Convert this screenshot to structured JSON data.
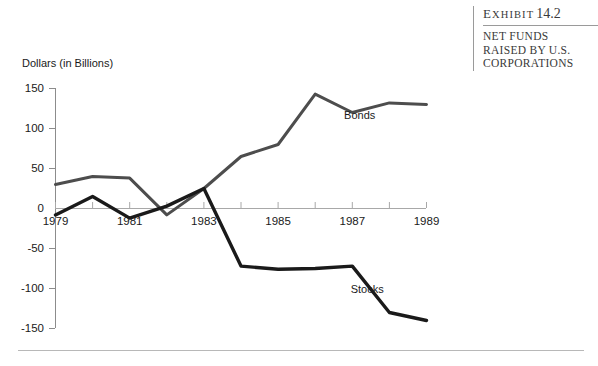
{
  "exhibit": {
    "label_word": "Exhibit",
    "number": "14.2",
    "title_lines": [
      "NET FUNDS",
      "RAISED BY U.S.",
      "CORPORATIONS"
    ]
  },
  "chart_data": {
    "type": "line",
    "title": "",
    "xlabel": "",
    "ylabel": "Dollars (in Billions)",
    "x": [
      1979,
      1980,
      1981,
      1982,
      1983,
      1984,
      1985,
      1986,
      1987,
      1988,
      1989
    ],
    "xtick_labels": [
      "1979",
      "1981",
      "1983",
      "1985",
      "1987",
      "1989"
    ],
    "xtick_values": [
      1979,
      1981,
      1983,
      1985,
      1987,
      1989
    ],
    "xlim": [
      1979,
      1989
    ],
    "ytick_labels": [
      "150",
      "100",
      "50",
      "0",
      "-50",
      "-100",
      "-150"
    ],
    "ytick_values": [
      150,
      100,
      50,
      0,
      -50,
      -100,
      -150
    ],
    "ylim": [
      -150,
      150
    ],
    "grid": false,
    "legend_position": "inline-annotation",
    "series": [
      {
        "name": "Bonds",
        "color": "#4d4d4d",
        "values": [
          30,
          40,
          38,
          -8,
          25,
          65,
          80,
          143,
          120,
          132,
          130
        ]
      },
      {
        "name": "Stocks",
        "color": "#1a1a1a",
        "values": [
          -8,
          15,
          -12,
          3,
          25,
          -72,
          -76,
          -75,
          -72,
          -130,
          -140
        ]
      }
    ],
    "annotations": [
      {
        "text": "Bonds",
        "x": 1987.2,
        "y": 112
      },
      {
        "text": "Stocks",
        "x": 1987.4,
        "y": -105
      }
    ]
  }
}
